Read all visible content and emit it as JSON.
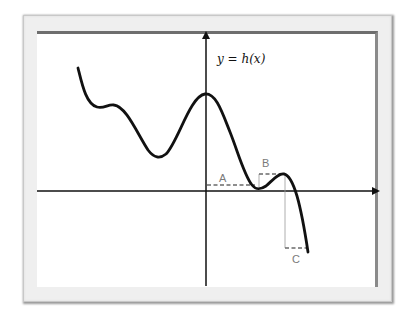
{
  "figure": {
    "function_label": "y = h(x)",
    "markers": [
      {
        "id": "A",
        "label": "A"
      },
      {
        "id": "B",
        "label": "B"
      },
      {
        "id": "C",
        "label": "C"
      }
    ]
  },
  "colors": {
    "curve": "#111111",
    "axes": "#111111",
    "marker_lines": "#6a6a6a",
    "frame_mat": "#efefef",
    "frame_border": "#6e6e6e"
  }
}
